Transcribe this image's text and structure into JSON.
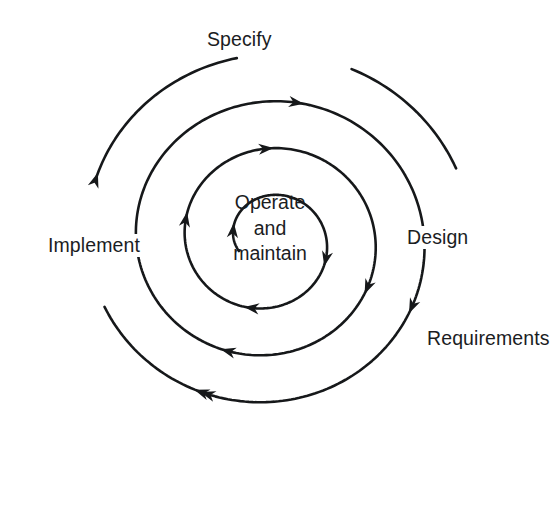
{
  "diagram": {
    "type": "spiral-model",
    "background_color": "#ffffff",
    "stroke_color": "#16181a",
    "text_color": "#1b1d1f",
    "turns": 3.5,
    "direction": "clockwise-inward",
    "center": {
      "x": 268,
      "y": 240
    }
  },
  "labels": {
    "specify": "Specify",
    "design": "Design",
    "requirements": "Requirements",
    "implement": "Implement",
    "operate_and_maintain": "Operate\nand\nmaintain"
  },
  "phases": [
    {
      "name": "Requirements",
      "position": "outer-right",
      "x": 424,
      "y": 327
    },
    {
      "name": "Specify",
      "position": "top",
      "x": 204,
      "y": 28
    },
    {
      "name": "Design",
      "position": "right",
      "x": 404,
      "y": 226
    },
    {
      "name": "Implement",
      "position": "left",
      "x": 45,
      "y": 234
    },
    {
      "name": "Operate and maintain",
      "position": "center",
      "x": 222,
      "y": 190
    }
  ],
  "arrows": [
    {
      "id": "a1",
      "at": "inner-left-up",
      "direction": "up",
      "x": 213,
      "y": 228
    },
    {
      "id": "a2",
      "at": "inner-bottom-left",
      "direction": "left",
      "x": 252,
      "y": 297
    },
    {
      "id": "a3",
      "at": "inner-right-down",
      "direction": "down",
      "x": 318,
      "y": 258
    },
    {
      "id": "a4",
      "at": "turn1-top-right",
      "direction": "right",
      "x": 268,
      "y": 160
    },
    {
      "id": "a5",
      "at": "turn1-left-up",
      "direction": "up",
      "x": 168,
      "y": 216
    },
    {
      "id": "a6",
      "at": "turn1-bottom-left",
      "direction": "left",
      "x": 226,
      "y": 353
    },
    {
      "id": "a7",
      "at": "turn2-right-down",
      "direction": "down",
      "x": 371,
      "y": 290
    },
    {
      "id": "a8",
      "at": "turn2-top-right",
      "direction": "right",
      "x": 296,
      "y": 106
    },
    {
      "id": "a9",
      "at": "turn2-left-up",
      "direction": "up",
      "x": 111,
      "y": 193
    },
    {
      "id": "a10",
      "at": "turn2-bottom-left",
      "direction": "left",
      "x": 201,
      "y": 411
    },
    {
      "id": "a11",
      "at": "outer-right-down",
      "direction": "down",
      "x": 428,
      "y": 315
    },
    {
      "id": "a12",
      "at": "outer-top-right",
      "direction": "right",
      "x": 323,
      "y": 51
    },
    {
      "id": "a13",
      "at": "outer-left-up",
      "direction": "up",
      "x": 58,
      "y": 167
    },
    {
      "id": "a14",
      "at": "outer-bottom-left",
      "direction": "left",
      "x": 173,
      "y": 466
    }
  ]
}
